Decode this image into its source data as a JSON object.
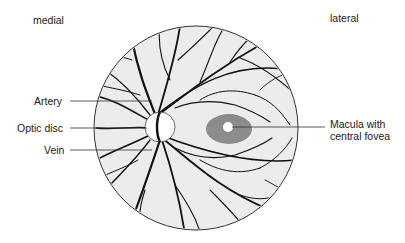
{
  "diagram": {
    "orientation": {
      "left": "medial",
      "right": "lateral"
    },
    "labels": {
      "artery": "Artery",
      "optic_disc": "Optic disc",
      "vein": "Vein",
      "macula_line1": "Macula with",
      "macula_line2": "central fovea"
    },
    "structures": {
      "fundus": {
        "cx": 196,
        "cy": 128,
        "r": 102,
        "fill": "#ececec",
        "stroke": "#333333"
      },
      "optic_disc": {
        "cx": 160,
        "cy": 127,
        "r": 15,
        "fill": "#ffffff"
      },
      "macula": {
        "cx": 229,
        "cy": 129,
        "rx": 23,
        "ry": 15,
        "fill": "#8c8c8c"
      },
      "fovea": {
        "cx": 228,
        "cy": 127,
        "r": 5,
        "fill": "#ffffff"
      }
    },
    "colors": {
      "vessel": "#111111",
      "leader_line": "#333333",
      "background": "#ffffff"
    }
  }
}
